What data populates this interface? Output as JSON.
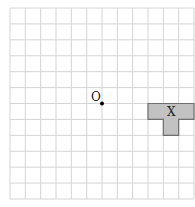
{
  "diagram": {
    "grid": {
      "columns": 12,
      "rows": 12,
      "line_color": "#d4d4d4"
    },
    "origin": {
      "label": "O",
      "col": 6,
      "row": 6
    },
    "shape": {
      "label": "X",
      "fill": "#c2c2c2",
      "stroke": "#6e6e6e",
      "cells": [
        [
          9,
          6
        ],
        [
          10,
          6
        ],
        [
          11,
          6
        ],
        [
          10,
          7
        ]
      ]
    }
  }
}
